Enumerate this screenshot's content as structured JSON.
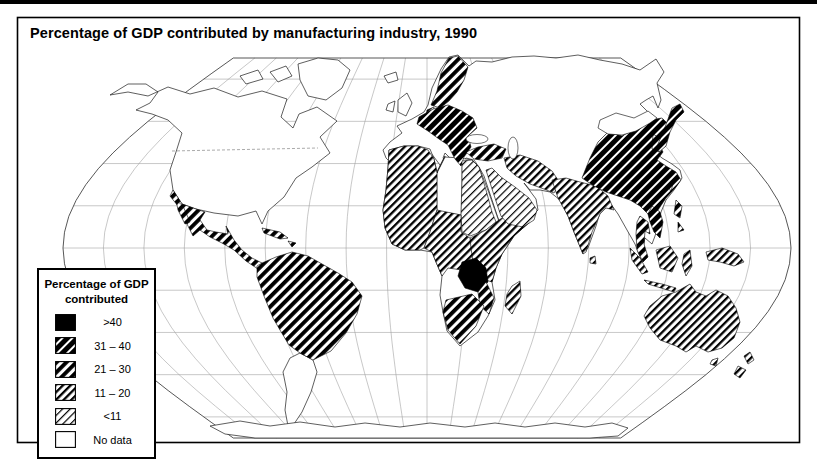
{
  "title": "Percentage of GDP contributed by manufacturing industry, 1990",
  "legend": {
    "title_line1": "Percentage of GDP",
    "title_line2": "contributed",
    "items": [
      {
        "label": ">40",
        "category": "gt40"
      },
      {
        "label": "31 – 40",
        "category": "31-40"
      },
      {
        "label": "21 – 30",
        "category": "21-30"
      },
      {
        "label": "11 – 20",
        "category": "11-20"
      },
      {
        "label": "<11",
        "category": "lt11"
      },
      {
        "label": "No data",
        "category": "no-data"
      }
    ]
  },
  "map_data": {
    "type": "choropleth",
    "projection": "robinson-style world map with graticule",
    "year": "1990",
    "categories": [
      ">40",
      "31 – 40",
      "21 – 30",
      "11 – 20",
      "<11",
      "No data"
    ],
    "category_colors": {
      "gt40": "#000000",
      "31-40": "heavy black diagonal hatch",
      "21-30": "thick black diagonal hatch",
      "11-20": "medium black diagonal hatch",
      "lt11": "light black diagonal hatch",
      "no-data": "#ffffff"
    },
    "regions": [
      {
        "name": "canada-usa",
        "category": "no-data"
      },
      {
        "name": "greenland",
        "category": "no-data"
      },
      {
        "name": "iceland",
        "category": "no-data"
      },
      {
        "name": "uk-ireland",
        "category": "no-data"
      },
      {
        "name": "western-europe",
        "category": "no-data"
      },
      {
        "name": "scandinavia",
        "category": "21-30"
      },
      {
        "name": "central-eastern-europe",
        "category": "31-40"
      },
      {
        "name": "turkey",
        "category": "21-30"
      },
      {
        "name": "russia-central-asia",
        "category": "no-data"
      },
      {
        "name": "mexico-central-america",
        "category": "21-30"
      },
      {
        "name": "cuba-caribbean",
        "category": "21-30"
      },
      {
        "name": "south-america-north",
        "category": "21-30"
      },
      {
        "name": "argentina-chile",
        "category": "no-data"
      },
      {
        "name": "northwest-africa",
        "category": "11-20"
      },
      {
        "name": "libya-chad",
        "category": "no-data"
      },
      {
        "name": "egypt-sudan",
        "category": "lt11"
      },
      {
        "name": "east-africa",
        "category": "11-20"
      },
      {
        "name": "west-central-africa",
        "category": "11-20"
      },
      {
        "name": "zambia-zimbabwe",
        "category": "gt40"
      },
      {
        "name": "mozambique",
        "category": "21-30"
      },
      {
        "name": "south-africa",
        "category": "21-30"
      },
      {
        "name": "namibia-botswana",
        "category": "no-data"
      },
      {
        "name": "madagascar",
        "category": "11-20"
      },
      {
        "name": "arabian-peninsula",
        "category": "lt11"
      },
      {
        "name": "iran-pakistan",
        "category": "11-20"
      },
      {
        "name": "india",
        "category": "11-20"
      },
      {
        "name": "china",
        "category": "31-40"
      },
      {
        "name": "mongolia",
        "category": "no-data"
      },
      {
        "name": "korea",
        "category": "31-40"
      },
      {
        "name": "japan",
        "category": "31-40"
      },
      {
        "name": "taiwan",
        "category": "31-40"
      },
      {
        "name": "myanmar",
        "category": "no-data"
      },
      {
        "name": "vietnam",
        "category": "31-40"
      },
      {
        "name": "thailand-malaysia",
        "category": "21-30"
      },
      {
        "name": "philippines",
        "category": "21-30"
      },
      {
        "name": "indonesia",
        "category": "11-20"
      },
      {
        "name": "new-guinea",
        "category": "11-20"
      },
      {
        "name": "australia",
        "category": "11-20"
      },
      {
        "name": "new-zealand",
        "category": "11-20"
      },
      {
        "name": "antarctica",
        "category": "no-data"
      }
    ]
  }
}
